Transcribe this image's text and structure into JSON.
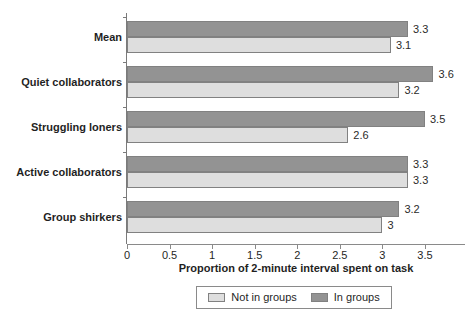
{
  "chart_data": {
    "type": "bar",
    "orientation": "horizontal",
    "title": "",
    "xlabel": "Proportion of 2-minute interval spent on task",
    "ylabel": "",
    "xlim": [
      0,
      3.97
    ],
    "xticks": [
      0,
      0.5,
      1,
      1.5,
      2,
      2.5,
      3,
      3.5
    ],
    "xticklabels": [
      "0",
      "0.5",
      "1",
      "1.5",
      "2",
      "2.5",
      "3",
      "3.5"
    ],
    "grid": false,
    "legend_position": "bottom",
    "categories": [
      "Mean",
      "Quiet collaborators",
      "Struggling loners",
      "Active collaborators",
      "Group shirkers"
    ],
    "series": [
      {
        "name": "In groups",
        "color": "#939393",
        "values": [
          3.3,
          3.6,
          3.5,
          3.3,
          3.2
        ],
        "labels": [
          "3.3",
          "3.6",
          "3.5",
          "3.3",
          "3.2"
        ]
      },
      {
        "name": "Not in groups",
        "color": "#dedede",
        "values": [
          3.1,
          3.2,
          2.6,
          3.3,
          3.0
        ],
        "labels": [
          "3.1",
          "3.2",
          "2.6",
          "3.3",
          "3"
        ]
      }
    ]
  },
  "legend": {
    "entries": [
      {
        "label": "Not in groups",
        "swatch": "not-in-groups"
      },
      {
        "label": "In groups",
        "swatch": "in-groups"
      }
    ]
  }
}
